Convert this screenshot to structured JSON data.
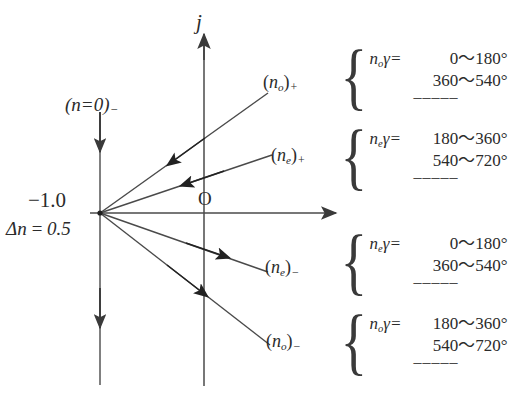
{
  "figure": {
    "type": "phasor-fan-diagram",
    "axes": {
      "imaginary_axis_label": "j",
      "origin_label": "O",
      "real_axis_label": ""
    },
    "left_markers": {
      "top_label": "(n=0)",
      "top_label_sign": "−",
      "value_above_axis": "−1.0",
      "value_below_axis": "Δn = 0.5"
    },
    "rays": [
      {
        "name": "no-plus",
        "base": "n",
        "subscript": "o",
        "sign": "+",
        "label_open": "(",
        "label_close": ")"
      },
      {
        "name": "ne-plus",
        "base": "n",
        "subscript": "e",
        "sign": "+",
        "label_open": "(",
        "label_close": ")"
      },
      {
        "name": "ne-minus",
        "base": "n",
        "subscript": "e",
        "sign": "−",
        "label_open": "(",
        "label_close": ")"
      },
      {
        "name": "no-minus",
        "base": "n",
        "subscript": "o",
        "sign": "−",
        "label_open": "(",
        "label_close": ")"
      }
    ],
    "annotations": [
      {
        "head_base": "n",
        "head_sub": "o",
        "head_gamma": "γ",
        "head_eq": "=",
        "values": [
          "0～180°",
          "360～540°"
        ],
        "continuation": "–––––"
      },
      {
        "head_base": "n",
        "head_sub": "e",
        "head_gamma": "γ",
        "head_eq": "=",
        "values": [
          "180～360°",
          "540～720°"
        ],
        "continuation": "–––––"
      },
      {
        "head_base": "n",
        "head_sub": "e",
        "head_gamma": "γ",
        "head_eq": "=",
        "values": [
          "0～180°",
          "360～540°"
        ],
        "continuation": "–––––"
      },
      {
        "head_base": "n",
        "head_sub": "o",
        "head_gamma": "γ",
        "head_eq": "=",
        "values": [
          "180～360°",
          "540～720°"
        ],
        "continuation": "–––––"
      }
    ],
    "colors": {
      "ink": "#2b2b2b",
      "line": "#4a4a4a",
      "background": "#ffffff"
    }
  }
}
